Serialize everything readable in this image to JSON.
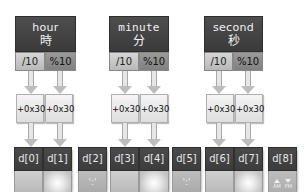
{
  "units": [
    {
      "name": "hour",
      "kanji": "時",
      "div": "/10",
      "mod": "%10"
    },
    {
      "name": "minute",
      "kanji": "分",
      "div": "/10",
      "mod": "%10"
    },
    {
      "name": "second",
      "kanji": "秒",
      "div": "/10",
      "mod": "%10"
    }
  ],
  "add_label": "+0x30",
  "cells": [
    {
      "label": "d[0]",
      "content": ""
    },
    {
      "label": "d[1]",
      "content": ""
    },
    {
      "label": "d[2]",
      "content": "':'"
    },
    {
      "label": "d[3]",
      "content": ""
    },
    {
      "label": "d[4]",
      "content": ""
    },
    {
      "label": "d[5]",
      "content": "':'"
    },
    {
      "label": "d[6]",
      "content": ""
    },
    {
      "label": "d[7]",
      "content": ""
    },
    {
      "label": "d[8]",
      "content": "",
      "am": "AM",
      "pm": "PM"
    }
  ],
  "colors": {
    "header": "#444444",
    "op_div": "#c8c8c8",
    "op_mod": "#8c8c8c",
    "add_box": "#ececec"
  }
}
